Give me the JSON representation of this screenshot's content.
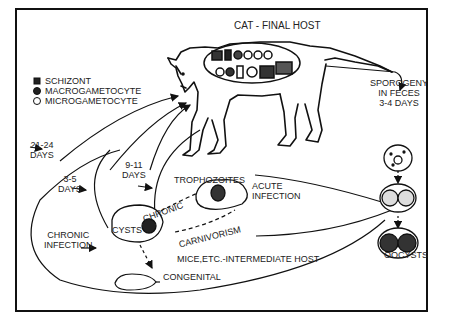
{
  "diagram": {
    "title": "CAT - FINAL HOST",
    "legend": [
      {
        "icon": "schizont-icon",
        "label": "SCHIZONT"
      },
      {
        "icon": "macrogametocyte-icon",
        "label": "MACROGAMETOCYTE"
      },
      {
        "icon": "microgametocyte-icon",
        "label": "MICROGAMETOCYTE"
      }
    ],
    "labels": {
      "days_21_24": [
        "21-24",
        "DAYS"
      ],
      "days_3_5": [
        "3-5",
        "DAYS"
      ],
      "days_9_11": [
        "9-11",
        "DAYS"
      ],
      "trophozoites": "TROPHOZOITES",
      "acute_infection": [
        "ACUTE",
        "INFECTION"
      ],
      "chronic": "CHRONIC",
      "cysts": "CYSTS",
      "carnivorism": "CARNIVORISM",
      "chronic_infection": [
        "CHRONIC",
        "INFECTION"
      ],
      "intermediate_host": "MICE,ETC.-INTERMEDIATE HOST",
      "congenital": "CONGENITAL",
      "sporogeny": [
        "SPOROGENY",
        "IN FECES",
        "3-4 DAYS"
      ],
      "oocysts": "OOCYSTS"
    },
    "colors": {
      "line": "#111111",
      "text": "#222222",
      "background": "#ffffff"
    }
  }
}
